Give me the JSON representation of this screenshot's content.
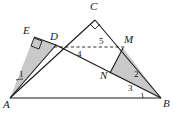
{
  "figure": {
    "background_color": "#ffffff",
    "stroke_color": "#1a1a1a",
    "shade_color": "#c9c9c9",
    "vertices": [
      {
        "name": "A",
        "label": "A",
        "x": 10,
        "y": 98,
        "label_x": 4,
        "label_y": 101
      },
      {
        "name": "B",
        "label": "B",
        "x": 161,
        "y": 98,
        "label_x": 163,
        "label_y": 100
      },
      {
        "name": "C",
        "label": "C",
        "x": 95,
        "y": 20,
        "label_x": 91,
        "label_y": 3
      },
      {
        "name": "E",
        "label": "E",
        "x": 34,
        "y": 37,
        "label_x": 24,
        "label_y": 27
      },
      {
        "name": "D",
        "label": "D",
        "x": 56,
        "y": 45,
        "label_x": 52,
        "label_y": 32
      },
      {
        "name": "M",
        "label": "M",
        "x": 123,
        "y": 48,
        "label_x": 126,
        "label_y": 36
      },
      {
        "name": "N",
        "label": "N",
        "x": 110,
        "y": 73,
        "label_x": 102,
        "label_y": 72
      }
    ],
    "angle_labels": [
      {
        "name": "angle-1",
        "label": "1",
        "x": 21,
        "y": 75
      },
      {
        "name": "angle-2",
        "label": "2",
        "x": 135,
        "y": 75
      },
      {
        "name": "angle-3",
        "label": "3",
        "x": 130,
        "y": 88
      },
      {
        "name": "angle-4",
        "label": "4",
        "x": 79,
        "y": 53
      },
      {
        "name": "angle-5",
        "label": "5",
        "x": 100,
        "y": 40
      }
    ],
    "right_angle_marks": [
      {
        "name": "right-angle-at-C",
        "at": "C"
      },
      {
        "name": "right-angle-at-E",
        "at": "E"
      }
    ],
    "shaded_regions": [
      {
        "name": "shaded-triangle-AED",
        "points": "A,E,D"
      },
      {
        "name": "shaded-triangle-MNB",
        "points": "M,N,B"
      }
    ],
    "dashed_segments": [
      {
        "name": "dashed-segment-DM",
        "from": "D",
        "to": "M"
      }
    ],
    "solid_segments": [
      {
        "name": "segment-AB",
        "from": "A",
        "to": "B"
      },
      {
        "name": "segment-AC",
        "from": "A",
        "to": "C"
      },
      {
        "name": "segment-CB",
        "from": "C",
        "to": "B"
      },
      {
        "name": "segment-AE",
        "from": "A",
        "to": "E"
      },
      {
        "name": "segment-ED",
        "from": "E",
        "to": "D"
      },
      {
        "name": "segment-AD-B",
        "from": "A",
        "to": "B",
        "through": "D"
      },
      {
        "name": "segment-MN",
        "from": "M",
        "to": "N"
      },
      {
        "name": "segment-MB",
        "from": "M",
        "to": "B"
      }
    ]
  }
}
